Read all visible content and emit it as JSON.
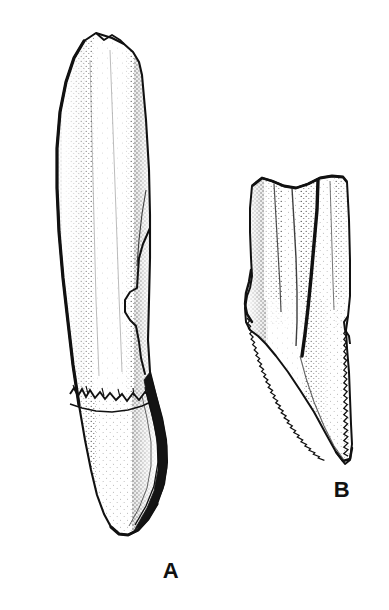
{
  "figure": {
    "type": "scientific-line-illustration",
    "background_color": "#ffffff",
    "ink_color": "#111111",
    "technique": "pen-and-ink stipple shading",
    "width": 389,
    "height": 610
  },
  "specimens": [
    {
      "id": "A",
      "label": "A",
      "label_x": 171,
      "label_y": 578,
      "description": "elongate slightly recurved tooth with long root and pointed crown",
      "bbox": {
        "x": 55,
        "y": 32,
        "width": 115,
        "height": 505
      },
      "features": [
        {
          "name": "root",
          "description": "long tapering root occupying upper two thirds"
        },
        {
          "name": "crown-root-junction",
          "description": "irregular jagged enamel margin across mid shaft"
        },
        {
          "name": "crown",
          "description": "pointed distally curved crown"
        },
        {
          "name": "carina",
          "description": "dark narrow cutting edge along distal margin of crown"
        },
        {
          "name": "lateral-notch",
          "description": "stepped notch on right margin of root"
        }
      ]
    },
    {
      "id": "B",
      "label": "B",
      "label_x": 342,
      "label_y": 497,
      "description": "broad triangular tooth crown with serrated carinae",
      "bbox": {
        "x": 243,
        "y": 175,
        "width": 110,
        "height": 290
      },
      "features": [
        {
          "name": "broken-root-edge",
          "description": "undulating broken upper margin"
        },
        {
          "name": "longitudinal-ridges",
          "description": "vertical ridges and grooves on crown face"
        },
        {
          "name": "mesial-carina",
          "description": "serrated anterior cutting edge with fine denticles"
        },
        {
          "name": "distal-carina",
          "description": "serrated posterior cutting edge with coarser denticles"
        },
        {
          "name": "apex",
          "description": "sharp downward pointing tip"
        },
        {
          "name": "basal-shoulder",
          "description": "pronounced shoulder at base of crown on left"
        }
      ]
    }
  ]
}
